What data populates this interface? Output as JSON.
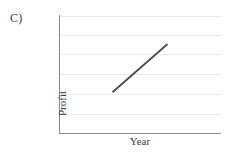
{
  "panel": {
    "label": "C)"
  },
  "chart_data": {
    "type": "line",
    "title": "",
    "subtitle": "",
    "xlabel": "Year",
    "ylabel": "Profit",
    "x": [
      1,
      2
    ],
    "values": [
      2.1,
      4.5
    ],
    "series": [
      {
        "name": "Profit trend",
        "x": [
          1,
          2
        ],
        "values": [
          2.1,
          4.5
        ]
      }
    ],
    "xlim": [
      0,
      3
    ],
    "ylim": [
      0,
      6
    ],
    "xticks": [],
    "yticks": [],
    "xticklabels": [],
    "yticklabels": [],
    "grid": "horizontal",
    "gridline_count": 6,
    "gridline_positions": [
      1,
      17,
      33,
      50,
      67,
      84
    ],
    "legend": "none",
    "annotations": [],
    "trend": "increasing-linear",
    "line_color": "#4d4d4d",
    "grid_color": "#e9e9e9",
    "axis_color": "#8a8a8a",
    "background_color": "#ffffff"
  }
}
